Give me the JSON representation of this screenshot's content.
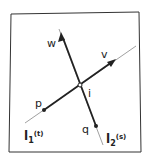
{
  "diagram": {
    "type": "line-intersection",
    "labels": {
      "w": "w",
      "v": "v",
      "i": "i",
      "p": "p",
      "q": "q",
      "l1_base": "l",
      "l1_sub": "1",
      "l1_param": "(t)",
      "l2_base": "l",
      "l2_sub": "2",
      "l2_param": "(s)"
    },
    "colors": {
      "ink": "#222222",
      "thin_line": "#777777",
      "paper_border": "#333333"
    }
  }
}
